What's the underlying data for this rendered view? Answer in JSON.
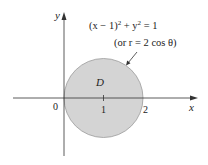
{
  "figure": {
    "axes": {
      "x_label": "x",
      "y_label": "y",
      "origin_label": "0",
      "x_ticks": [
        "1",
        "2"
      ]
    },
    "region_label": "D",
    "equation_cartesian": {
      "lhs_open": "(x − 1)",
      "sup1": "2",
      "mid": " + y",
      "sup2": "2",
      "rhs": " = 1"
    },
    "equation_polar": "(or r = 2 cos θ)",
    "colors": {
      "region_fill": "#d4d4d4",
      "region_stroke": "#9a9a9a",
      "axis": "#333333",
      "text": "#222222"
    }
  }
}
